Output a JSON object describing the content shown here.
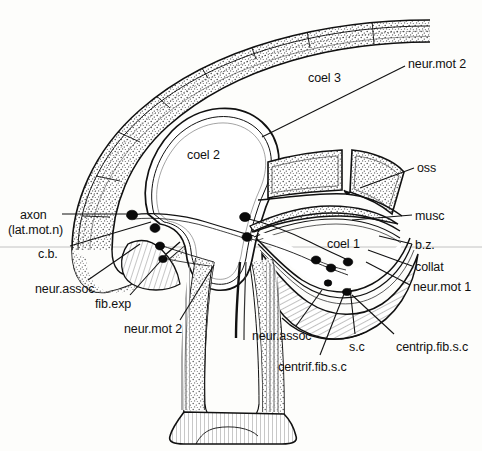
{
  "figure": {
    "type": "anatomical-cross-section",
    "background_color": "#fdfdfb",
    "ink_color": "#111111",
    "stipple_fill": "#d8d6d0",
    "hatch_fill": "#ededea",
    "guide_line_color": "#b9b9b9",
    "guide_line_y": 247
  },
  "labels": [
    {
      "id": "neur-mot-2-top",
      "text": "neur.mot 2",
      "x": 408,
      "y": 58,
      "anchor": "start",
      "leader": [
        [
          405,
          66
        ],
        [
          262,
          137
        ]
      ]
    },
    {
      "id": "coel-3",
      "text": "coel 3",
      "x": 308,
      "y": 72,
      "anchor": "start",
      "leader": null
    },
    {
      "id": "coel-2",
      "text": "coel 2",
      "x": 187,
      "y": 149,
      "anchor": "start",
      "leader": null
    },
    {
      "id": "oss",
      "text": "oss",
      "x": 417,
      "y": 162,
      "anchor": "start",
      "leader": [
        [
          414,
          168
        ],
        [
          360,
          188
        ]
      ]
    },
    {
      "id": "musc",
      "text": "musc",
      "x": 415,
      "y": 210,
      "anchor": "start",
      "leader": [
        [
          412,
          215
        ],
        [
          352,
          220
        ]
      ]
    },
    {
      "id": "axon",
      "text": "axon",
      "x": 20,
      "y": 209,
      "anchor": "start",
      "leader": [
        [
          62,
          214
        ],
        [
          126,
          214
        ]
      ]
    },
    {
      "id": "lat-mot-n",
      "text": "(lat.mot.n)",
      "x": 8,
      "y": 224,
      "anchor": "start",
      "leader": null
    },
    {
      "id": "coel-1",
      "text": "coel 1",
      "x": 327,
      "y": 238,
      "anchor": "start",
      "leader": null
    },
    {
      "id": "b-z",
      "text": "b.z.",
      "x": 415,
      "y": 239,
      "anchor": "start",
      "leader": [
        [
          412,
          244
        ],
        [
          379,
          236
        ]
      ]
    },
    {
      "id": "c-b",
      "text": "c.b.",
      "x": 38,
      "y": 248,
      "anchor": "start",
      "leader": [
        [
          70,
          246
        ],
        [
          151,
          222
        ]
      ]
    },
    {
      "id": "collat",
      "text": "collat",
      "x": 415,
      "y": 261,
      "anchor": "start",
      "leader": [
        [
          412,
          266
        ],
        [
          368,
          250
        ]
      ]
    },
    {
      "id": "neur-mot-1",
      "text": "neur.mot 1",
      "x": 413,
      "y": 281,
      "anchor": "start",
      "leader": [
        [
          410,
          285
        ],
        [
          366,
          262
        ]
      ]
    },
    {
      "id": "neur-assoc-left",
      "text": "neur.assoc",
      "x": 35,
      "y": 283,
      "anchor": "start",
      "leader": [
        [
          88,
          280
        ],
        [
          140,
          244
        ]
      ]
    },
    {
      "id": "fib-exp",
      "text": "fib.exp",
      "x": 95,
      "y": 298,
      "anchor": "start",
      "leader": [
        [
          130,
          295
        ],
        [
          166,
          255
        ]
      ]
    },
    {
      "id": "neur-mot-2-bottom",
      "text": "neur.mot 2",
      "x": 124,
      "y": 323,
      "anchor": "start",
      "leader": [
        [
          180,
          320
        ],
        [
          214,
          265
        ]
      ]
    },
    {
      "id": "neur-assoc-right",
      "text": "neur.assoc",
      "x": 252,
      "y": 330,
      "anchor": "start",
      "leader": [
        [
          296,
          326
        ],
        [
          322,
          290
        ]
      ]
    },
    {
      "id": "s-c",
      "text": "s.c",
      "x": 349,
      "y": 341,
      "anchor": "start",
      "leader": [
        [
          355,
          334
        ],
        [
          350,
          288
        ]
      ]
    },
    {
      "id": "centrip-fib-s-c",
      "text": "centrip.fib.s.c",
      "x": 396,
      "y": 341,
      "anchor": "start",
      "leader": [
        [
          394,
          334
        ],
        [
          352,
          295
        ]
      ]
    },
    {
      "id": "centrif-fib-s-c",
      "text": "centrif.fib.s.c",
      "x": 278,
      "y": 361,
      "anchor": "start",
      "leader": [
        [
          320,
          355
        ],
        [
          344,
          294
        ]
      ]
    }
  ],
  "structures": [
    {
      "id": "outer-body-wall",
      "name": "outer body wall band (stippled)"
    },
    {
      "id": "coel-3-cavity",
      "name": "coelomic cavity 3"
    },
    {
      "id": "coel-2-cavity",
      "name": "coelomic cavity 2"
    },
    {
      "id": "coel-1-cavity",
      "name": "coelomic cavity 1"
    },
    {
      "id": "ossicle-left",
      "name": "left ossicle plate"
    },
    {
      "id": "ossicle-right",
      "name": "right ossicle plate"
    },
    {
      "id": "muscle-band",
      "name": "muscle band"
    },
    {
      "id": "ventral-stalk",
      "name": "ventral stalk / pedicle"
    },
    {
      "id": "stalk-foot",
      "name": "stalk basal foot (hatched)"
    },
    {
      "id": "neuron-cluster-left",
      "name": "left neuron cell bodies"
    },
    {
      "id": "neuron-cluster-right",
      "name": "right neuron cell bodies"
    }
  ],
  "neurons": [
    {
      "id": "n1",
      "cx": 132,
      "cy": 215,
      "r": 5.0
    },
    {
      "id": "n2",
      "cx": 155,
      "cy": 228,
      "r": 4.6
    },
    {
      "id": "n3",
      "cx": 160,
      "cy": 245,
      "r": 4.2
    },
    {
      "id": "n4",
      "cx": 163,
      "cy": 258,
      "r": 3.8
    },
    {
      "id": "n5",
      "cx": 245,
      "cy": 217,
      "r": 5.0
    },
    {
      "id": "n6",
      "cx": 247,
      "cy": 237,
      "r": 4.8
    },
    {
      "id": "n7",
      "cx": 316,
      "cy": 260,
      "r": 4.4
    },
    {
      "id": "n8",
      "cx": 331,
      "cy": 268,
      "r": 4.4
    },
    {
      "id": "n9",
      "cx": 348,
      "cy": 262,
      "r": 4.4
    },
    {
      "id": "n10",
      "cx": 328,
      "cy": 283,
      "r": 3.6
    },
    {
      "id": "n11",
      "cx": 347,
      "cy": 292,
      "r": 4.2
    }
  ]
}
